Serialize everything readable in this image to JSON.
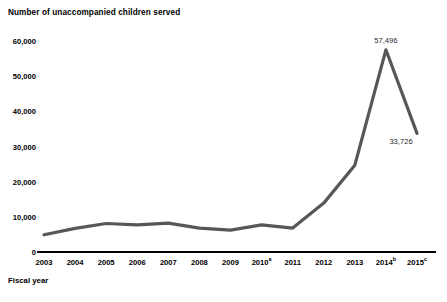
{
  "chart_data": {
    "type": "line",
    "title": "Number of unaccompanied children served",
    "xlabel": "Fiscal year",
    "ylabel": "",
    "grid": false,
    "legend": false,
    "ylim": [
      0,
      60000
    ],
    "ytick_labels": [
      "60,000",
      "50,000",
      "40,000",
      "30,000",
      "20,000",
      "10,000",
      "0"
    ],
    "ytick_values": [
      60000,
      50000,
      40000,
      30000,
      20000,
      10000,
      0
    ],
    "categories": [
      "2003",
      "2004",
      "2005",
      "2006",
      "2007",
      "2008",
      "2009",
      "2010",
      "2011",
      "2012",
      "2013",
      "2014",
      "2015"
    ],
    "xtick_labels": [
      {
        "text": "2003",
        "sup": ""
      },
      {
        "text": "2004",
        "sup": ""
      },
      {
        "text": "2005",
        "sup": ""
      },
      {
        "text": "2006",
        "sup": ""
      },
      {
        "text": "2007",
        "sup": ""
      },
      {
        "text": "2008",
        "sup": ""
      },
      {
        "text": "2009",
        "sup": ""
      },
      {
        "text": "2010",
        "sup": "a"
      },
      {
        "text": "2011",
        "sup": ""
      },
      {
        "text": "2012",
        "sup": ""
      },
      {
        "text": "2013",
        "sup": ""
      },
      {
        "text": "2014",
        "sup": "b"
      },
      {
        "text": "2015",
        "sup": "c"
      }
    ],
    "series": [
      {
        "name": "Unaccompanied children served",
        "color": "#575757",
        "values": [
          4900,
          6700,
          8100,
          7700,
          8200,
          6800,
          6200,
          7700,
          6800,
          13900,
          24700,
          57496,
          33726
        ]
      }
    ],
    "annotations": [
      {
        "category": "2014",
        "value": 57496,
        "text": "57,496",
        "position": "above"
      },
      {
        "category": "2015",
        "value": 33726,
        "text": "33,726",
        "position": "below-left"
      }
    ]
  },
  "colors": {
    "line": "#575757",
    "axis": "#000000",
    "text": "#000000",
    "label_text": "#2b2b2b",
    "background": "#ffffff"
  }
}
